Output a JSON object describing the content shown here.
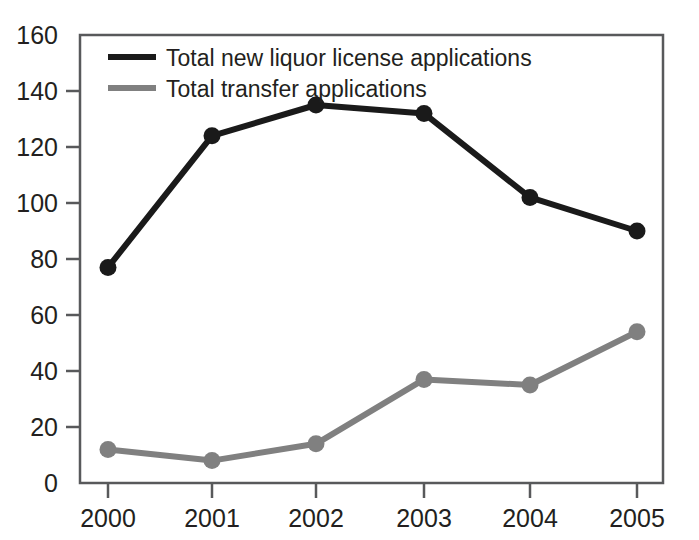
{
  "chart_data": {
    "type": "line",
    "title": "",
    "subtitle": "",
    "xlabel": "",
    "ylabel": "",
    "categories": [
      "2000",
      "2001",
      "2002",
      "2003",
      "2004",
      "2005"
    ],
    "x": [
      2000,
      2001,
      2002,
      2003,
      2004,
      2005
    ],
    "series": [
      {
        "name": "Total new liquor license applications",
        "color": "#1a1a1a",
        "values": [
          77,
          124,
          135,
          132,
          102,
          90
        ],
        "marker": "circle"
      },
      {
        "name": "Total transfer applications",
        "color": "#808080",
        "values": [
          12,
          8,
          14,
          37,
          35,
          54
        ],
        "marker": "circle"
      }
    ],
    "ylim": [
      0,
      160
    ],
    "ytick_labels": [
      "0",
      "20",
      "40",
      "60",
      "80",
      "100",
      "120",
      "140",
      "160"
    ],
    "ytick_values": [
      0,
      20,
      40,
      60,
      80,
      100,
      120,
      140,
      160
    ],
    "xtick_labels": [
      "2000",
      "2001",
      "2002",
      "2003",
      "2004",
      "2005"
    ],
    "grid": false,
    "legend_position": "top-left-inside",
    "axis_color": "#58595b",
    "plot_border": true
  },
  "legend": {
    "entries": [
      {
        "label": "Total new liquor license applications",
        "swatch_color": "#1a1a1a"
      },
      {
        "label": "Total transfer applications",
        "swatch_color": "#808080"
      }
    ]
  },
  "axes": {
    "y_ticks": [
      {
        "label": "160",
        "value": 160
      },
      {
        "label": "140",
        "value": 140
      },
      {
        "label": "120",
        "value": 120
      },
      {
        "label": "100",
        "value": 100
      },
      {
        "label": "80",
        "value": 80
      },
      {
        "label": "60",
        "value": 60
      },
      {
        "label": "40",
        "value": 40
      },
      {
        "label": "20",
        "value": 20
      },
      {
        "label": "0",
        "value": 0
      }
    ],
    "x_ticks": [
      {
        "label": "2000",
        "value": 2000
      },
      {
        "label": "2001",
        "value": 2001
      },
      {
        "label": "2002",
        "value": 2002
      },
      {
        "label": "2003",
        "value": 2003
      },
      {
        "label": "2004",
        "value": 2004
      },
      {
        "label": "2005",
        "value": 2005
      }
    ]
  }
}
